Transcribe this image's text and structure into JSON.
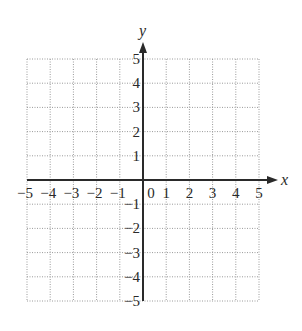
{
  "chart_data": {
    "type": "scatter",
    "title": "",
    "xlabel": "x",
    "ylabel": "y",
    "xlim": [
      -5,
      5
    ],
    "ylim": [
      -5,
      5
    ],
    "grid": true,
    "grid_style": "dotted",
    "x_ticks": [
      -5,
      -4,
      -3,
      -2,
      -1,
      0,
      1,
      2,
      3,
      4,
      5
    ],
    "y_ticks": [
      -5,
      -4,
      -3,
      -2,
      -1,
      1,
      2,
      3,
      4,
      5
    ],
    "x_tick_labels": [
      "−5",
      "−4",
      "−3",
      "−2",
      "−1",
      "0",
      "1",
      "2",
      "3",
      "4",
      "5"
    ],
    "y_tick_labels": [
      "5",
      "4",
      "3",
      "2",
      "1",
      "−1",
      "−2",
      "−3",
      "−4",
      "−5"
    ],
    "series": [],
    "legend": null
  },
  "layout": {
    "grid_left": 27,
    "grid_right": 259,
    "grid_top": 59,
    "grid_bottom": 301,
    "origin_x": 143,
    "origin_y": 180,
    "y_arrow_tip": 42,
    "x_arrow_tip": 278
  },
  "colors": {
    "axis": "#2a2a2a",
    "grid": "#9a9a9a",
    "background": "#ffffff"
  }
}
